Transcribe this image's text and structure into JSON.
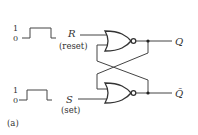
{
  "diagram": {
    "type": "SR latch (NOR)",
    "panel_label": "(a)",
    "inputs": [
      {
        "name": "R",
        "description": "(reset)",
        "waveform": {
          "high_label": "1",
          "low_label": "0"
        }
      },
      {
        "name": "S",
        "description": "(set)",
        "waveform": {
          "high_label": "1",
          "low_label": "0"
        }
      }
    ],
    "outputs": [
      {
        "name": "Q"
      },
      {
        "name": "Q̄"
      }
    ],
    "gates": [
      {
        "type": "NOR",
        "position": "top"
      },
      {
        "type": "NOR",
        "position": "bottom"
      }
    ],
    "colors": {
      "line": "#444444",
      "text": "#333333",
      "background": "#ffffff"
    }
  }
}
